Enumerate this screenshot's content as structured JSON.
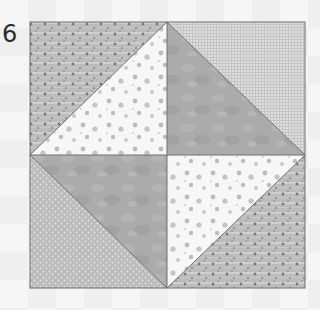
{
  "figure": {
    "label": "6",
    "block": {
      "x": 30,
      "y": 22,
      "width": 275,
      "height": 266
    },
    "center": {
      "x": 167,
      "y": 155
    },
    "colors": {
      "speckled": "#b4b4b4",
      "floral_white": "#f6f6f6",
      "mottled_gray": "#a9a9a9",
      "grid_light": "#d9d9d9",
      "dotted": "#bdbdbd",
      "seam": "#6e6e6e"
    },
    "pieces": [
      {
        "name": "top-left-outer",
        "fabric": "speckled"
      },
      {
        "name": "top-left-inner",
        "fabric": "floral_white"
      },
      {
        "name": "top-right-inner",
        "fabric": "mottled_gray"
      },
      {
        "name": "top-right-outer",
        "fabric": "grid_light"
      },
      {
        "name": "bottom-left-inner",
        "fabric": "mottled_gray"
      },
      {
        "name": "bottom-left-outer",
        "fabric": "dotted"
      },
      {
        "name": "bottom-right-inner",
        "fabric": "floral_white"
      },
      {
        "name": "bottom-right-outer",
        "fabric": "speckled"
      }
    ]
  }
}
